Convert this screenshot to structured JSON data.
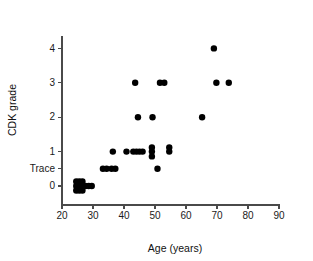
{
  "chart_data": {
    "type": "scatter",
    "title": "",
    "xlabel": "Age (years)",
    "ylabel": "CDK grade",
    "xlim": [
      20,
      90
    ],
    "ylim": [
      -0.55,
      4.35
    ],
    "grid": false,
    "legend": null,
    "x_ticks": [
      20,
      30,
      40,
      50,
      60,
      70,
      80,
      90
    ],
    "x_tick_labels": [
      "20",
      "30",
      "40",
      "50",
      "60",
      "70",
      "80",
      "90"
    ],
    "y_ticks": [
      0,
      0.5,
      1,
      2,
      3,
      4
    ],
    "y_tick_labels": [
      "0",
      "Trace",
      "1",
      "2",
      "3",
      "4"
    ],
    "y_category_order": [
      "0",
      "Trace",
      "1",
      "2",
      "3",
      "4"
    ],
    "marker": "filled-circle",
    "marker_color": "#000000",
    "marker_size_px": 3.2,
    "points": [
      {
        "x": 24.6,
        "y": 0.13,
        "grade": "0"
      },
      {
        "x": 25.6,
        "y": 0.13,
        "grade": "0"
      },
      {
        "x": 26.6,
        "y": 0.13,
        "grade": "0"
      },
      {
        "x": 24.6,
        "y": 0.0,
        "grade": "0"
      },
      {
        "x": 25.6,
        "y": 0.0,
        "grade": "0"
      },
      {
        "x": 26.6,
        "y": 0.0,
        "grade": "0"
      },
      {
        "x": 27.6,
        "y": 0.0,
        "grade": "0"
      },
      {
        "x": 28.6,
        "y": 0.0,
        "grade": "0"
      },
      {
        "x": 29.6,
        "y": 0.0,
        "grade": "0"
      },
      {
        "x": 24.6,
        "y": -0.13,
        "grade": "0"
      },
      {
        "x": 25.6,
        "y": -0.13,
        "grade": "0"
      },
      {
        "x": 26.6,
        "y": -0.13,
        "grade": "0"
      },
      {
        "x": 33.2,
        "y": 0.5,
        "grade": "Trace"
      },
      {
        "x": 34.4,
        "y": 0.5,
        "grade": "Trace"
      },
      {
        "x": 36.0,
        "y": 0.5,
        "grade": "Trace"
      },
      {
        "x": 37.2,
        "y": 0.5,
        "grade": "Trace"
      },
      {
        "x": 50.8,
        "y": 0.5,
        "grade": "Trace"
      },
      {
        "x": 36.4,
        "y": 1.0,
        "grade": "1"
      },
      {
        "x": 40.8,
        "y": 1.0,
        "grade": "1"
      },
      {
        "x": 43.0,
        "y": 1.0,
        "grade": "1"
      },
      {
        "x": 44.0,
        "y": 1.0,
        "grade": "1"
      },
      {
        "x": 45.0,
        "y": 1.0,
        "grade": "1"
      },
      {
        "x": 46.0,
        "y": 1.0,
        "grade": "1"
      },
      {
        "x": 49.0,
        "y": 1.12,
        "grade": "1"
      },
      {
        "x": 49.0,
        "y": 1.0,
        "grade": "1"
      },
      {
        "x": 49.0,
        "y": 0.86,
        "grade": "1"
      },
      {
        "x": 54.6,
        "y": 1.12,
        "grade": "1"
      },
      {
        "x": 54.6,
        "y": 1.0,
        "grade": "1"
      },
      {
        "x": 44.5,
        "y": 2.0,
        "grade": "2"
      },
      {
        "x": 49.2,
        "y": 2.0,
        "grade": "2"
      },
      {
        "x": 65.2,
        "y": 2.0,
        "grade": "2"
      },
      {
        "x": 43.6,
        "y": 3.0,
        "grade": "3"
      },
      {
        "x": 51.6,
        "y": 3.0,
        "grade": "3"
      },
      {
        "x": 53.0,
        "y": 3.0,
        "grade": "3"
      },
      {
        "x": 69.8,
        "y": 3.0,
        "grade": "3"
      },
      {
        "x": 73.8,
        "y": 3.0,
        "grade": "3"
      },
      {
        "x": 69.0,
        "y": 4.0,
        "grade": "4"
      }
    ]
  },
  "axes": {
    "x_axis_name": "age-axis",
    "y_axis_name": "cdk-grade-axis"
  }
}
